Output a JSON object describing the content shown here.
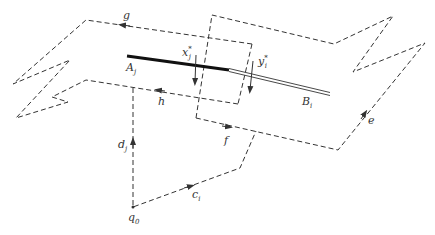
{
  "labels": {
    "g": "g",
    "h": "h",
    "f": "f",
    "e": "e",
    "d": "d",
    "d_sub": "j",
    "c": "c",
    "c_sub": "i",
    "q": "q",
    "q_sub": "0",
    "A": "A",
    "A_sub": "j",
    "B": "B",
    "B_sub": "i",
    "x": "x",
    "x_sub": "j",
    "x_sup": "*",
    "y": "y",
    "y_sub": "i",
    "y_sup": "*"
  },
  "colors": {
    "ink": "#333333",
    "background": "#ffffff"
  }
}
